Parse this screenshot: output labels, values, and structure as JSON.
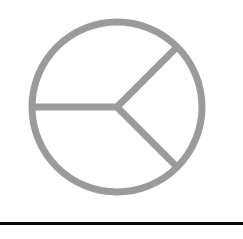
{
  "page": {
    "background_color": "#ffffff",
    "width": 243,
    "height": 239
  },
  "figure": {
    "name": "three-sector-pie-diagram",
    "stroke_color": "#9b9b9b",
    "stroke_width": 7,
    "center_x": 117,
    "center_y": 107,
    "radius": 85,
    "spokes": [
      {
        "label": "spoke-left",
        "angle_deg": 180
      },
      {
        "label": "spoke-upper-right",
        "angle_deg": 315
      },
      {
        "label": "spoke-lower-right",
        "angle_deg": 45
      }
    ]
  },
  "rule": {
    "label": "horizontal-rule",
    "color": "#0a0a0a",
    "thickness": 3,
    "y": 222
  },
  "caption": {
    "text": ""
  },
  "chart_data": {
    "type": "pie",
    "title": "",
    "xlabel": "",
    "ylabel": "",
    "categories": [
      "Sector A",
      "Sector B",
      "Sector C"
    ],
    "values": [
      225,
      90,
      45
    ],
    "unit": "degrees",
    "percentages": [
      62.5,
      25.0,
      12.5
    ],
    "legend": [],
    "annotations": [],
    "grid": false,
    "legend_position": "none",
    "colors": [
      "#ffffff",
      "#ffffff",
      "#ffffff"
    ],
    "outline_color": "#9b9b9b"
  }
}
